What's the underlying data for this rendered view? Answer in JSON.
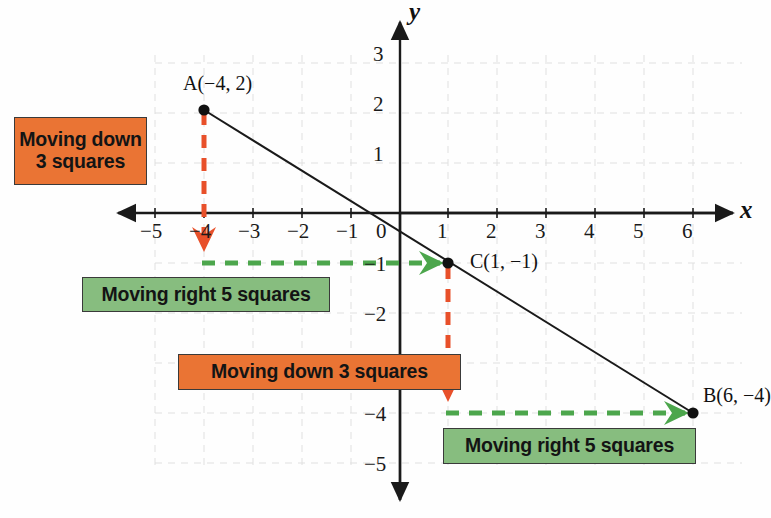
{
  "figure": {
    "type": "coordinate-plane-diagram",
    "axis_names": {
      "x": "x",
      "y": "y"
    },
    "x_ticks": [
      "−5",
      "−4",
      "−3",
      "−2",
      "−1",
      "0",
      "1",
      "2",
      "3",
      "4",
      "5",
      "6"
    ],
    "y_ticks": [
      "3",
      "2",
      "1",
      "−1",
      "−2",
      "−4",
      "−5"
    ],
    "colors": {
      "orange": "#ea7434",
      "green": "#87bd7f",
      "orange_arrow": "#e8502a",
      "green_arrow": "#4ca64c",
      "line": "#1a1a1a",
      "grid": "#e3e3e3"
    }
  },
  "points": [
    {
      "name": "A",
      "label": "A(−4, 2)",
      "x": -4,
      "y": 2
    },
    {
      "name": "C",
      "label": "C(1, −1)",
      "x": 1,
      "y": -1
    },
    {
      "name": "B",
      "label": "B(6, −4)",
      "x": 6,
      "y": -4
    }
  ],
  "callouts": [
    {
      "id": "down-1",
      "text": "Moving down\n3 squares",
      "color": "orange"
    },
    {
      "id": "right-1",
      "text": "Moving right 5 squares",
      "color": "green"
    },
    {
      "id": "down-2",
      "text": "Moving down 3 squares",
      "color": "orange"
    },
    {
      "id": "right-2",
      "text": "Moving right 5 squares",
      "color": "green"
    }
  ],
  "chart_data": {
    "type": "line",
    "title": "",
    "xlabel": "x",
    "ylabel": "y",
    "xlim": [
      -5.6,
      6.6
    ],
    "ylim": [
      -5.6,
      3.6
    ],
    "grid": true,
    "series": [
      {
        "name": "Line AB",
        "x": [
          -4,
          1,
          6
        ],
        "y": [
          2,
          -1,
          -4
        ],
        "point_labels": [
          "A(−4, 2)",
          "C(1, −1)",
          "B(6, −4)"
        ]
      }
    ],
    "annotations": [
      {
        "text": "Moving down 3 squares",
        "from": [
          -4,
          2
        ],
        "to": [
          -4,
          -1
        ],
        "color": "#e8502a"
      },
      {
        "text": "Moving right 5 squares",
        "from": [
          -4,
          -1
        ],
        "to": [
          1,
          -1
        ],
        "color": "#4ca64c"
      },
      {
        "text": "Moving down 3 squares",
        "from": [
          1,
          -1
        ],
        "to": [
          1,
          -4
        ],
        "color": "#e8502a"
      },
      {
        "text": "Moving right 5 squares",
        "from": [
          1,
          -4
        ],
        "to": [
          6,
          -4
        ],
        "color": "#4ca64c"
      }
    ]
  },
  "tick_positions": {
    "x": [
      {
        "label": "−5",
        "left": 140,
        "top": 219
      },
      {
        "label": "−4",
        "left": 189,
        "top": 219
      },
      {
        "label": "−3",
        "left": 238,
        "top": 219
      },
      {
        "label": "−2",
        "left": 287,
        "top": 219
      },
      {
        "label": "−1",
        "left": 336,
        "top": 219
      },
      {
        "label": "0",
        "left": 376,
        "top": 219
      },
      {
        "label": "1",
        "left": 437,
        "top": 219
      },
      {
        "label": "2",
        "left": 486,
        "top": 219
      },
      {
        "label": "3",
        "left": 535,
        "top": 219
      },
      {
        "label": "4",
        "left": 584,
        "top": 219
      },
      {
        "label": "5",
        "left": 633,
        "top": 219
      },
      {
        "label": "6",
        "left": 682,
        "top": 219
      }
    ],
    "y": [
      {
        "label": "3",
        "left": 373,
        "top": 42
      },
      {
        "label": "2",
        "left": 373,
        "top": 92
      },
      {
        "label": "1",
        "left": 373,
        "top": 142
      },
      {
        "label": "−1",
        "left": 364,
        "top": 252
      },
      {
        "label": "−2",
        "left": 364,
        "top": 302
      },
      {
        "label": "−4",
        "left": 364,
        "top": 402
      },
      {
        "label": "−5",
        "left": 364,
        "top": 452
      }
    ]
  }
}
